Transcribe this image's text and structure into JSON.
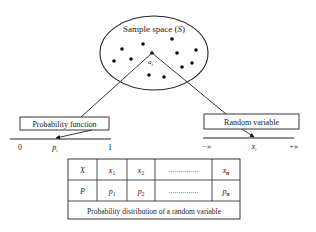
{
  "sample_space": {
    "title": "Sample space (S)",
    "title_plain": "Sample space (",
    "title_symbol": "S",
    "title_close": ")",
    "ellipse": {
      "cx": 154,
      "cy": 53,
      "rx": 54,
      "ry": 37
    },
    "points": [
      {
        "x": 122,
        "y": 49
      },
      {
        "x": 143,
        "y": 44
      },
      {
        "x": 172,
        "y": 39
      },
      {
        "x": 114,
        "y": 61
      },
      {
        "x": 131,
        "y": 59
      },
      {
        "x": 152,
        "y": 53
      },
      {
        "x": 177,
        "y": 53
      },
      {
        "x": 196,
        "y": 50
      },
      {
        "x": 182,
        "y": 67
      },
      {
        "x": 192,
        "y": 63
      },
      {
        "x": 149,
        "y": 75
      },
      {
        "x": 164,
        "y": 77
      }
    ],
    "highlight_point_label": "a",
    "highlight_point_sub": "i"
  },
  "probability_function": {
    "label": "Probability function",
    "axis_start": "0",
    "axis_end": "1",
    "marker_label": "p",
    "marker_sub": "i"
  },
  "random_variable": {
    "label": "Random variable",
    "axis_start": "−∞",
    "axis_end": "+∞",
    "marker_label": "x",
    "marker_sub": "i"
  },
  "distribution_table": {
    "rows": [
      {
        "head": "X",
        "cells": [
          {
            "v": "x",
            "s": "1"
          },
          {
            "v": "x",
            "s": "2"
          },
          {
            "v": "……………",
            "s": ""
          },
          {
            "v": "x",
            "s": "n"
          }
        ]
      },
      {
        "head": "P",
        "cells": [
          {
            "v": "p",
            "s": "1"
          },
          {
            "v": "p",
            "s": "2"
          },
          {
            "v": "……………",
            "s": ""
          },
          {
            "v": "p",
            "s": "n"
          }
        ]
      }
    ],
    "caption": "Probability distribution of a random variable"
  }
}
